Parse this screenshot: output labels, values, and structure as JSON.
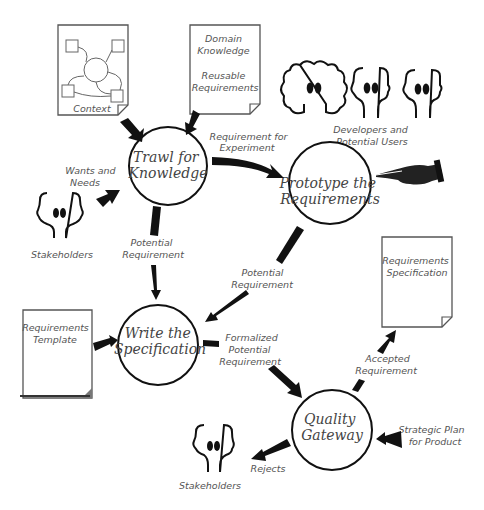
{
  "diagram": {
    "processes": {
      "trawl": [
        "Trawl for",
        "Knowledge"
      ],
      "prototype": [
        "Prototype the",
        "Requirements"
      ],
      "write": [
        "Write the",
        "Specification"
      ],
      "gateway": [
        "Quality",
        "Gateway"
      ]
    },
    "documents": {
      "context": "Context",
      "domain": [
        "Domain",
        "Knowledge",
        "",
        "Reusable",
        "Requirements"
      ],
      "template": [
        "Requirements",
        "Template"
      ],
      "spec": [
        "Requirements",
        "Specification"
      ]
    },
    "actors": {
      "developers": [
        "Developers and",
        "Potential Users"
      ],
      "stakeholders_top": "Stakeholders",
      "stakeholders_bottom": "Stakeholders"
    },
    "flows": {
      "wants": [
        "Wants and",
        "Needs"
      ],
      "experiment": [
        "Requirement for",
        "Experiment"
      ],
      "potential1": [
        "Potential",
        "Requirement"
      ],
      "potential2": [
        "Potential",
        "Requirement"
      ],
      "formalized": [
        "Formalized",
        "Potential",
        "Requirement"
      ],
      "accepted": [
        "Accepted",
        "Requirement"
      ],
      "strategic": [
        "Strategic Plan",
        "for Product"
      ],
      "rejects": "Rejects"
    }
  }
}
